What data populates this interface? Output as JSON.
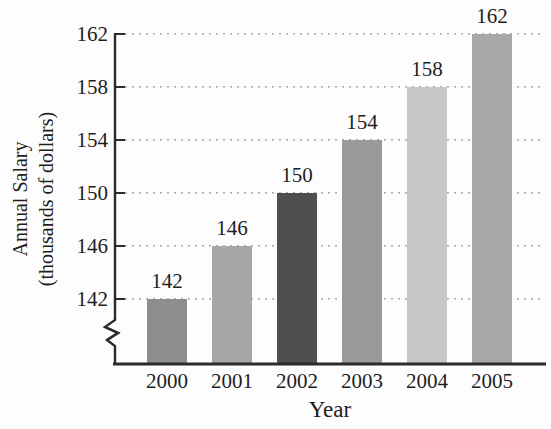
{
  "chart_data": {
    "type": "bar",
    "title": "",
    "xlabel": "Year",
    "ylabel": "Annual Salary (thousands of dollars)",
    "ylabel_line1": "Annual Salary",
    "ylabel_line2": "(thousands of dollars)",
    "categories": [
      "2000",
      "2001",
      "2002",
      "2003",
      "2004",
      "2005"
    ],
    "values": [
      142,
      146,
      150,
      154,
      158,
      162
    ],
    "value_labels": [
      "142",
      "146",
      "150",
      "154",
      "158",
      "162"
    ],
    "yticks": [
      142,
      146,
      150,
      154,
      158,
      162
    ],
    "ytick_labels": [
      "142",
      "146",
      "150",
      "154",
      "158",
      "162"
    ],
    "ylim": [
      142,
      162
    ],
    "axis_break": true,
    "grid": "horizontal-dotted",
    "legend_position": "none",
    "bar_colors": [
      "#8e8e8e",
      "#a6a6a6",
      "#4f4f4f",
      "#9a9a9a",
      "#c7c7c7",
      "#a8a8a8"
    ],
    "axis_color": "#2b2b2b",
    "gridline_color": "#ababab",
    "text_color": "#1e1e1e"
  }
}
